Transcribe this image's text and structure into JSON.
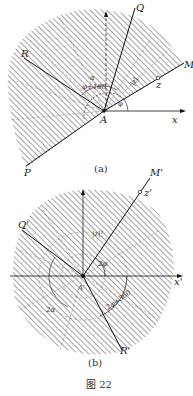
{
  "figure": {
    "caption": "图 22",
    "panel_a": {
      "caption": "(a)",
      "labels": {
        "Q": "Q",
        "R": "R",
        "M": "M",
        "P": "P",
        "A": "A",
        "x": "x",
        "z": "z",
        "alpha": "α",
        "phi": "φ",
        "phi_plus_180": "φ+180",
        "z_abs": "|z|"
      }
    },
    "panel_b": {
      "caption": "(b)",
      "labels": {
        "M_prime": "M'",
        "z_prime": "z'",
        "Q_prime": "Q'",
        "R_prime": "R'",
        "x_prime": "x'",
        "A_prime": "A'",
        "two_phi": "2φ",
        "two_alpha": "2α",
        "two_phi_plus_360": "2φ+360",
        "z_abs_sq": "|z|²"
      }
    },
    "colors": {
      "line": "#111111",
      "hatch": "#555555",
      "background": "#ffffff"
    }
  }
}
